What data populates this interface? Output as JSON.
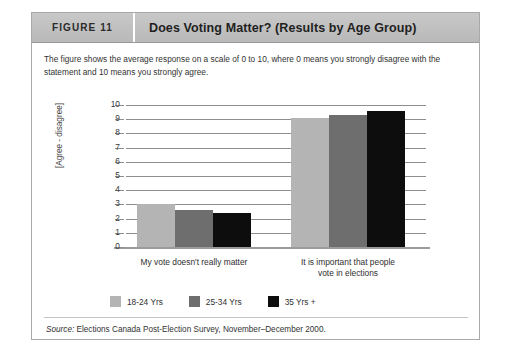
{
  "header": {
    "figure_number": "FIGURE 11",
    "title": "Does Voting Matter? (Results by Age Group)"
  },
  "description": "The figure shows the average response on a scale of 0 to 10, where 0 means you strongly disagree with the statement and 10 means you strongly agree.",
  "source": {
    "label": "Source:",
    "text": " Elections Canada Post-Election Survey, November–December 2000."
  },
  "colors": {
    "series_18_24": "#b4b4b4",
    "series_25_34": "#6e6e6e",
    "series_35_plus": "#0d0d0d",
    "header_band": "#c0c0c0",
    "gridline": "#8e8e8e",
    "frame_border": "#a9a9a9"
  },
  "chart_data": {
    "type": "bar",
    "title": "Does Voting Matter? (Results by Age Group)",
    "xlabel": "",
    "ylabel": "[Agree - disagree]",
    "ylim": [
      0,
      10
    ],
    "yticks": [
      0,
      1,
      2,
      3,
      4,
      5,
      6,
      7,
      8,
      9,
      10
    ],
    "ytick_labels": [
      "0",
      "1",
      "2",
      "3",
      "4",
      "5",
      "6",
      "7",
      "8",
      "9",
      "10"
    ],
    "grid": true,
    "legend_position": "bottom-left",
    "categories": [
      "My vote doesn't really matter",
      "It is important that people vote in elections"
    ],
    "category_lines": [
      [
        "My vote doesn't really matter"
      ],
      [
        "It is important that people",
        "vote in elections"
      ]
    ],
    "series": [
      {
        "name": "18-24 Yrs",
        "color": "#b4b4b4",
        "values": [
          3.0,
          9.1
        ]
      },
      {
        "name": "25-34 Yrs",
        "color": "#6e6e6e",
        "values": [
          2.6,
          9.3
        ]
      },
      {
        "name": "35 Yrs +",
        "color": "#0d0d0d",
        "values": [
          2.4,
          9.6
        ]
      }
    ]
  }
}
